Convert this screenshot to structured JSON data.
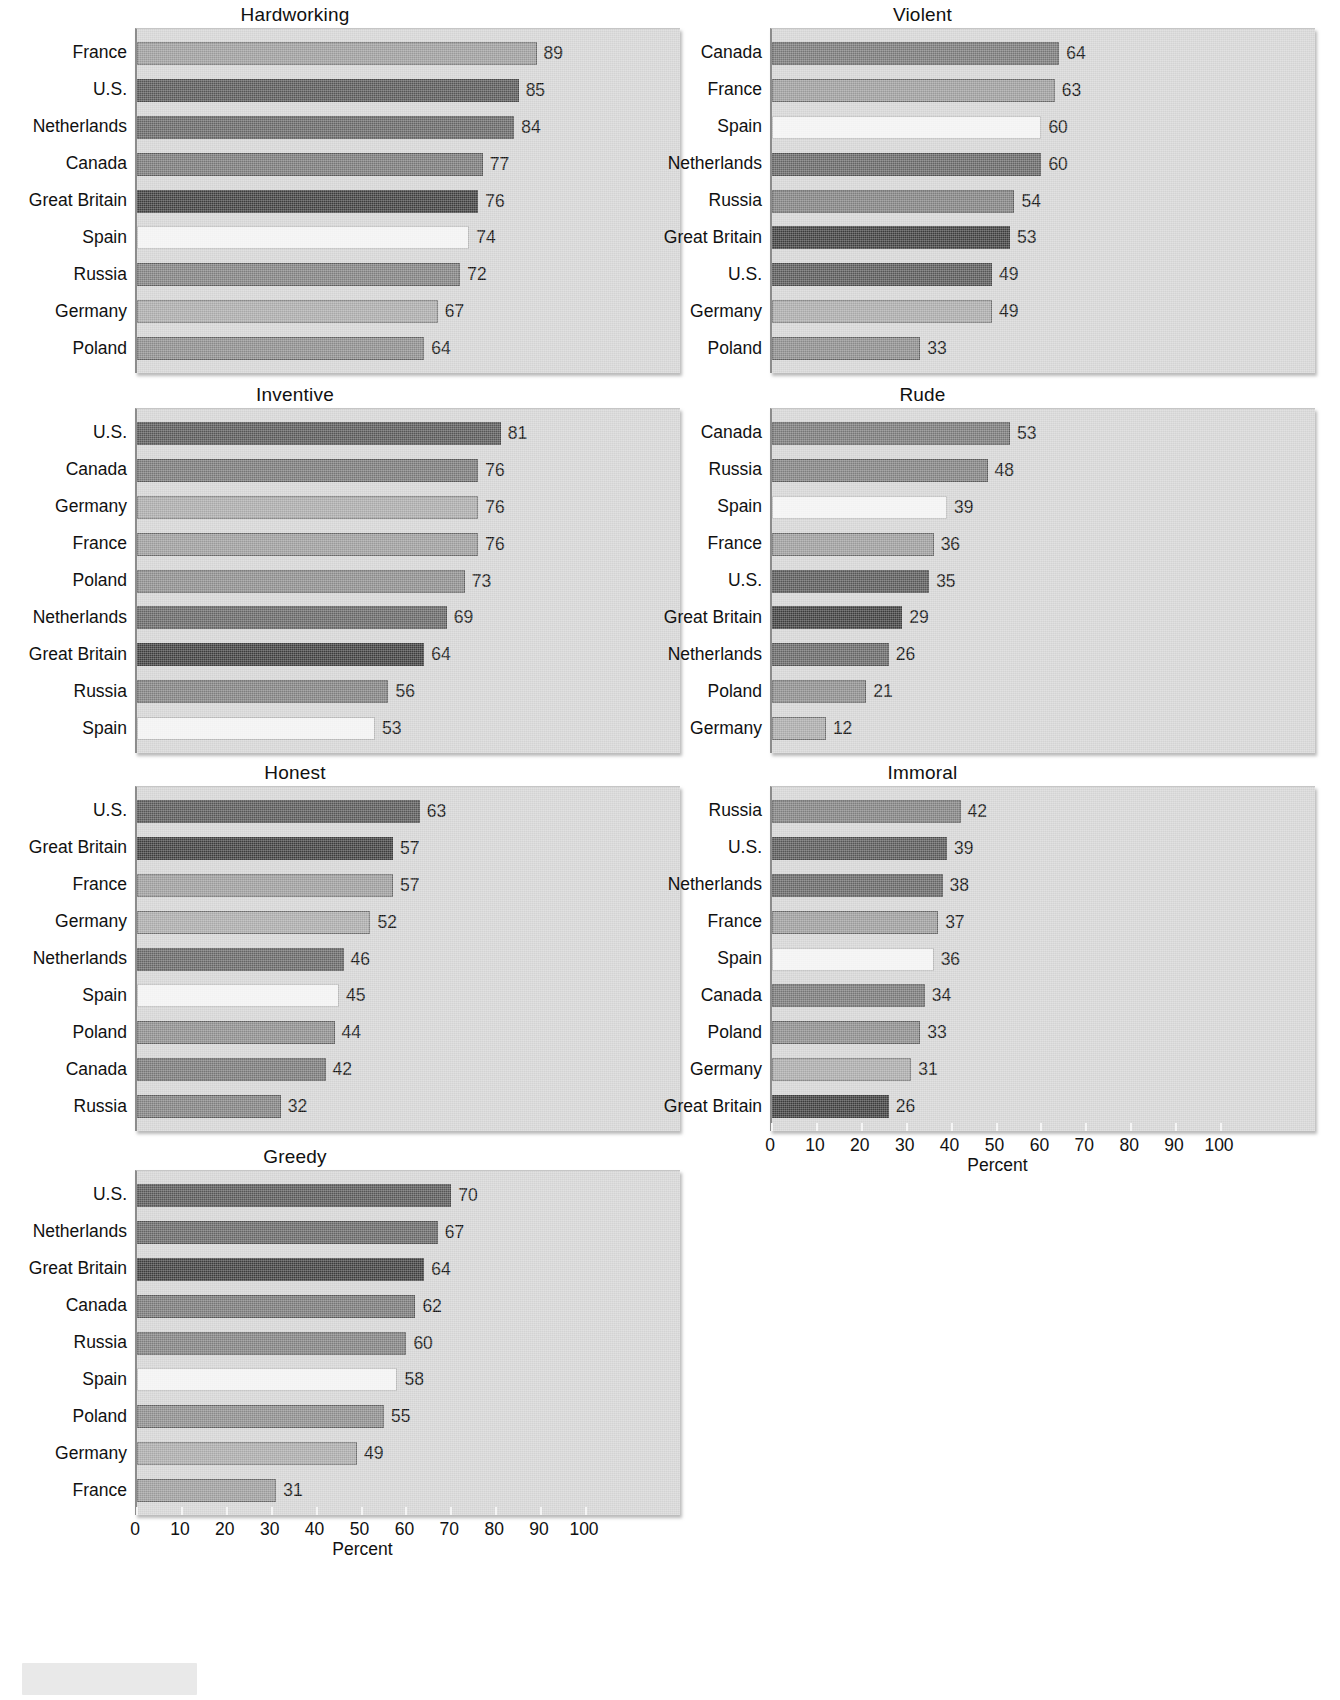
{
  "chart_data": {
    "type": "bar",
    "title": "",
    "orientation": "horizontal",
    "xlabel": "Percent",
    "ylabel": "",
    "xlim": [
      0,
      100
    ],
    "xticks": [
      0,
      10,
      20,
      30,
      40,
      50,
      60,
      70,
      80,
      90,
      100
    ],
    "grid": false,
    "legend": "none",
    "value_labels": true,
    "panel_layout": "2 columns x 4 rows (7 panels, last cell empty)",
    "country_colors": {
      "France": "#9a9a9a",
      "U.S.": "#565656",
      "Netherlands": "#646464",
      "Canada": "#767676",
      "Great Britain": "#3c3c3c",
      "Spain": "#f2f2f2",
      "Russia": "#7e7e7e",
      "Germany": "#a8a8a8",
      "Poland": "#8a8a8a"
    },
    "panels": [
      {
        "title": "Hardworking",
        "xlabel": "",
        "show_axis": false,
        "categories": [
          "France",
          "U.S.",
          "Netherlands",
          "Canada",
          "Great Britain",
          "Spain",
          "Russia",
          "Germany",
          "Poland"
        ],
        "values": [
          89,
          85,
          84,
          77,
          76,
          74,
          72,
          67,
          64
        ]
      },
      {
        "title": "Violent",
        "xlabel": "",
        "show_axis": false,
        "categories": [
          "Canada",
          "France",
          "Spain",
          "Netherlands",
          "Russia",
          "Great Britain",
          "U.S.",
          "Germany",
          "Poland"
        ],
        "values": [
          64,
          63,
          60,
          60,
          54,
          53,
          49,
          49,
          33
        ]
      },
      {
        "title": "Inventive",
        "xlabel": "",
        "show_axis": false,
        "categories": [
          "U.S.",
          "Canada",
          "Germany",
          "France",
          "Poland",
          "Netherlands",
          "Great Britain",
          "Russia",
          "Spain"
        ],
        "values": [
          81,
          76,
          76,
          76,
          73,
          69,
          64,
          56,
          53
        ]
      },
      {
        "title": "Rude",
        "xlabel": "",
        "show_axis": false,
        "categories": [
          "Canada",
          "Russia",
          "Spain",
          "France",
          "U.S.",
          "Great Britain",
          "Netherlands",
          "Poland",
          "Germany"
        ],
        "values": [
          53,
          48,
          39,
          36,
          35,
          29,
          26,
          21,
          12
        ]
      },
      {
        "title": "Honest",
        "xlabel": "",
        "show_axis": false,
        "categories": [
          "U.S.",
          "Great Britain",
          "France",
          "Germany",
          "Netherlands",
          "Spain",
          "Poland",
          "Canada",
          "Russia"
        ],
        "values": [
          63,
          57,
          57,
          52,
          46,
          45,
          44,
          42,
          32
        ]
      },
      {
        "title": "Immoral",
        "xlabel": "Percent",
        "show_axis": true,
        "categories": [
          "Russia",
          "U.S.",
          "Netherlands",
          "France",
          "Spain",
          "Canada",
          "Poland",
          "Germany",
          "Great Britain"
        ],
        "values": [
          42,
          39,
          38,
          37,
          36,
          34,
          33,
          31,
          26
        ]
      },
      {
        "title": "Greedy",
        "xlabel": "Percent",
        "show_axis": true,
        "categories": [
          "U.S.",
          "Netherlands",
          "Great Britain",
          "Canada",
          "Russia",
          "Spain",
          "Poland",
          "Germany",
          "France"
        ],
        "values": [
          70,
          67,
          64,
          62,
          60,
          58,
          55,
          49,
          31
        ]
      }
    ]
  }
}
